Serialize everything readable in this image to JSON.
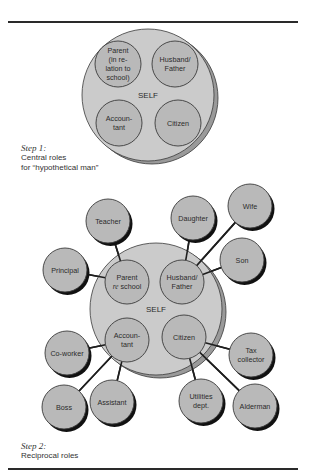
{
  "colors": {
    "self_fill": "#cbcbcb",
    "self_shadow": "#9a9a9a",
    "role_fill": "#b9b9b9",
    "outline": "#3a3a3a",
    "bubble_shadow": "#111111",
    "line": "#1e1e1e",
    "text": "#2b2b2b"
  },
  "step1": {
    "caption_step": "Step 1:",
    "caption_lines": [
      "Central roles",
      "for “hypothetical man”"
    ],
    "self": {
      "label": "SELF",
      "cx": 148,
      "cy": 95,
      "r": 66
    },
    "central_roles": [
      {
        "id": "parent",
        "lines": [
          "Parent",
          "(in re-",
          "lation to",
          "school)"
        ],
        "cx": 118,
        "cy": 64,
        "r": 23
      },
      {
        "id": "husband-father",
        "lines": [
          "Husband/",
          "Father"
        ],
        "cx": 175,
        "cy": 64,
        "r": 23
      },
      {
        "id": "accountant",
        "lines": [
          "Accoun-",
          "tant"
        ],
        "cx": 119,
        "cy": 123,
        "r": 23
      },
      {
        "id": "citizen",
        "lines": [
          "Citizen"
        ],
        "cx": 178,
        "cy": 123,
        "r": 23
      }
    ]
  },
  "step2": {
    "caption_step": "Step 2:",
    "caption_lines": [
      "Reciprocal roles"
    ],
    "self": {
      "label": "SELF",
      "cx": 156,
      "cy": 309,
      "r": 66
    },
    "central_roles": [
      {
        "id": "parent",
        "lines": [
          "Parent",
          "re school"
        ],
        "italic_word": "re",
        "cx": 127,
        "cy": 282,
        "r": 22
      },
      {
        "id": "husband-father",
        "lines": [
          "Husband/",
          "Father"
        ],
        "cx": 182,
        "cy": 282,
        "r": 22
      },
      {
        "id": "accountant",
        "lines": [
          "Accoun-",
          "tant"
        ],
        "cx": 127,
        "cy": 340,
        "r": 22
      },
      {
        "id": "citizen",
        "lines": [
          "Citizen"
        ],
        "cx": 184,
        "cy": 337,
        "r": 22
      }
    ],
    "reciprocal_roles": [
      {
        "id": "teacher",
        "lines": [
          "Teacher"
        ],
        "cx": 108,
        "cy": 221,
        "r": 22,
        "links_to": "parent"
      },
      {
        "id": "principal",
        "lines": [
          "Principal"
        ],
        "cx": 65,
        "cy": 270,
        "r": 22,
        "links_to": "parent"
      },
      {
        "id": "daughter",
        "lines": [
          "Daughter"
        ],
        "cx": 193,
        "cy": 218,
        "r": 22,
        "links_to": "husband-father"
      },
      {
        "id": "wife",
        "lines": [
          "Wife"
        ],
        "cx": 250,
        "cy": 206,
        "r": 22,
        "links_to": "husband-father"
      },
      {
        "id": "son",
        "lines": [
          "Son"
        ],
        "cx": 242,
        "cy": 260,
        "r": 22,
        "links_to": "husband-father"
      },
      {
        "id": "co-worker",
        "lines": [
          "Co-worker"
        ],
        "cx": 67,
        "cy": 353,
        "r": 22,
        "links_to": "accountant"
      },
      {
        "id": "boss",
        "lines": [
          "Boss"
        ],
        "cx": 64,
        "cy": 407,
        "r": 22,
        "links_to": "accountant"
      },
      {
        "id": "assistant",
        "lines": [
          "Assistant"
        ],
        "cx": 112,
        "cy": 402,
        "r": 22,
        "links_to": "accountant"
      },
      {
        "id": "tax-collector",
        "lines": [
          "Tax",
          "collector"
        ],
        "cx": 251,
        "cy": 355,
        "r": 22,
        "links_to": "citizen"
      },
      {
        "id": "utilities-dept",
        "lines": [
          "Utilities",
          "dept."
        ],
        "cx": 201,
        "cy": 401,
        "r": 22,
        "links_to": "citizen"
      },
      {
        "id": "alderman",
        "lines": [
          "Alderman"
        ],
        "cx": 255,
        "cy": 406,
        "r": 22,
        "links_to": "citizen"
      }
    ]
  }
}
